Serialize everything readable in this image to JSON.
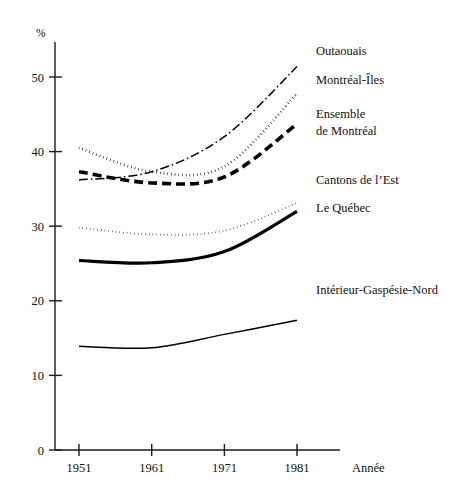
{
  "chart_data": {
    "type": "line",
    "title": "",
    "subtitle": "",
    "xlabel": "Année",
    "ylabel": "%",
    "x": [
      1951,
      1961,
      1971,
      1981
    ],
    "categories": [
      "1951",
      "1961",
      "1971",
      "1981"
    ],
    "xlim": [
      1946,
      1986
    ],
    "ylim": [
      0,
      55
    ],
    "yticks": [
      0,
      10,
      20,
      30,
      40,
      50
    ],
    "ytick_labels": [
      "0",
      "10",
      "20",
      "30",
      "40",
      "50"
    ],
    "xticks": [
      1951,
      1961,
      1971,
      1981
    ],
    "xtick_labels": [
      "1951",
      "1961",
      "1971",
      "1981"
    ],
    "grid": false,
    "legend_position": "right-inline-labels",
    "series": [
      {
        "name": "Outaouais",
        "style": "dash-dot",
        "label": "Outaouais",
        "values": [
          36.2,
          37.3,
          42.0,
          51.4
        ]
      },
      {
        "name": "Montréal-Îles",
        "style": "dotted-bold",
        "label": "Montréal-Îles",
        "values": [
          40.5,
          37.3,
          38.0,
          47.8
        ]
      },
      {
        "name": "Ensemble de Montréal",
        "style": "dashed-heavy",
        "label": "Ensemble\nde Montréal",
        "label_line1": "Ensemble",
        "label_line2": "de Montréal",
        "values": [
          37.3,
          35.8,
          36.6,
          43.7
        ]
      },
      {
        "name": "Cantons de l'Est",
        "style": "dotted-fine",
        "label": "Cantons de l’Est",
        "values": [
          29.8,
          28.9,
          29.4,
          33.1
        ]
      },
      {
        "name": "Le Québec",
        "style": "solid-heavy",
        "label": "Le Québec",
        "values": [
          25.4,
          25.1,
          26.6,
          32.0
        ]
      },
      {
        "name": "Intérieur-Gaspésie-Nord",
        "style": "solid-thin",
        "label": "Intérieur-Gaspésie-Nord",
        "values": [
          13.9,
          13.7,
          15.5,
          17.4
        ]
      }
    ]
  },
  "axis": {
    "y_unit": "%",
    "x_title": "Année"
  },
  "labels": {
    "outaouais": "Outaouais",
    "montreal_iles": "Montréal-Îles",
    "ensemble_l1": "Ensemble",
    "ensemble_l2": "de Montréal",
    "cantons": "Cantons de l’Est",
    "quebec": "Le Québec",
    "interieur": "Intérieur-Gaspésie-Nord"
  },
  "yticks": {
    "t0": "0",
    "t1": "10",
    "t2": "20",
    "t3": "30",
    "t4": "40",
    "t5": "50"
  },
  "xticks": {
    "t0": "1951",
    "t1": "1961",
    "t2": "1971",
    "t3": "1981"
  },
  "colors": {
    "ink": "#000000",
    "axis": "#1a1a1a",
    "background": "#ffffff"
  }
}
